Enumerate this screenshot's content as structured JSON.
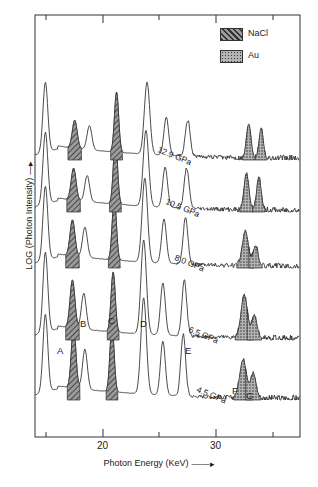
{
  "figure": {
    "kind": "energy-dispersive-x-ray-diffraction-spectra",
    "x_axis": {
      "label": "Photon Energy (KeV)",
      "ticks_major": [
        "20",
        "30"
      ]
    },
    "y_axis": {
      "label": "LOG (Photon Intensity)"
    }
  },
  "legend": {
    "items": [
      {
        "label": "NaCl",
        "pattern": "diagonal-hatch",
        "color": "#555555"
      },
      {
        "label": "Au",
        "pattern": "stipple-dots",
        "color": "#777777"
      }
    ]
  },
  "peak_labels": [
    {
      "id": "A",
      "x": 14.9,
      "trace": "4.5 GPa"
    },
    {
      "id": "B",
      "x": 17.4,
      "trace": "4.5 GPa"
    },
    {
      "id": "C",
      "x": 20.8,
      "trace": "4.5 GPa"
    },
    {
      "id": "D",
      "x": 23.6,
      "trace": "4.5 GPa"
    },
    {
      "id": "E",
      "x": 27.1,
      "trace": "4.5 GPa"
    },
    {
      "id": "F",
      "x": 32.4,
      "trace": "4.5 GPa"
    },
    {
      "id": "G",
      "x": 33.4,
      "trace": "4.5 GPa"
    }
  ],
  "chart_data": {
    "type": "line",
    "title": "",
    "xlabel": "Photon Energy (KeV)",
    "ylabel": "LOG (Photon Intensity)",
    "xlim": [
      13.6,
      37.4
    ],
    "ylim": [
      0,
      1
    ],
    "grid": false,
    "legend_position": "top-right",
    "stacked_offset": true,
    "tick_labels_x": [
      "20",
      "30"
    ],
    "minor_ticks_x": [
      15,
      25,
      35
    ],
    "series": [
      {
        "name": "4.5 GPa",
        "label": "4.5 GPa",
        "label_x": 28.3,
        "baseline_px": 400,
        "peaks": [
          {
            "id": "A",
            "x": 14.9,
            "h": 78,
            "w": 0.3,
            "fill": "none"
          },
          {
            "id": "B",
            "x": 17.4,
            "h": 62,
            "w": 0.28,
            "fill": "NaCl"
          },
          {
            "id": "B2",
            "x": 18.4,
            "h": 40,
            "w": 0.3,
            "fill": "none"
          },
          {
            "id": "C",
            "x": 20.8,
            "h": 66,
            "w": 0.26,
            "fill": "NaCl"
          },
          {
            "id": "D",
            "x": 23.6,
            "h": 96,
            "w": 0.34,
            "fill": "none"
          },
          {
            "id": "D2",
            "x": 25.3,
            "h": 54,
            "w": 0.3,
            "fill": "none"
          },
          {
            "id": "E",
            "x": 27.1,
            "h": 62,
            "w": 0.3,
            "fill": "none"
          },
          {
            "id": "F",
            "x": 32.4,
            "h": 38,
            "w": 0.42,
            "fill": "Au"
          },
          {
            "id": "G",
            "x": 33.3,
            "h": 24,
            "w": 0.34,
            "fill": "Au"
          }
        ]
      },
      {
        "name": "6.5 GPa",
        "label": "6.5 GPa",
        "label_x": 27.6,
        "baseline_px": 340,
        "peaks": [
          {
            "id": "A",
            "x": 14.9,
            "h": 80,
            "w": 0.3,
            "fill": "none"
          },
          {
            "id": "B",
            "x": 17.3,
            "h": 48,
            "w": 0.3,
            "fill": "NaCl"
          },
          {
            "id": "B2",
            "x": 18.3,
            "h": 36,
            "w": 0.3,
            "fill": "none"
          },
          {
            "id": "C",
            "x": 20.9,
            "h": 60,
            "w": 0.26,
            "fill": "NaCl"
          },
          {
            "id": "D",
            "x": 23.6,
            "h": 94,
            "w": 0.34,
            "fill": "none"
          },
          {
            "id": "D2",
            "x": 25.3,
            "h": 52,
            "w": 0.3,
            "fill": "none"
          },
          {
            "id": "E",
            "x": 27.2,
            "h": 56,
            "w": 0.3,
            "fill": "none"
          },
          {
            "id": "F",
            "x": 32.5,
            "h": 42,
            "w": 0.4,
            "fill": "Au"
          },
          {
            "id": "G",
            "x": 33.4,
            "h": 22,
            "w": 0.32,
            "fill": "Au"
          }
        ]
      },
      {
        "name": "8.0 GPa",
        "label": "8.0 GPa",
        "label_x": 26.4,
        "baseline_px": 268,
        "peaks": [
          {
            "id": "A",
            "x": 14.9,
            "h": 74,
            "w": 0.3,
            "fill": "none"
          },
          {
            "id": "B",
            "x": 17.3,
            "h": 36,
            "w": 0.3,
            "fill": "NaCl"
          },
          {
            "id": "B2",
            "x": 18.4,
            "h": 30,
            "w": 0.3,
            "fill": "none"
          },
          {
            "id": "C",
            "x": 21.0,
            "h": 62,
            "w": 0.26,
            "fill": "NaCl"
          },
          {
            "id": "D",
            "x": 23.7,
            "h": 84,
            "w": 0.34,
            "fill": "none"
          },
          {
            "id": "D2",
            "x": 25.4,
            "h": 44,
            "w": 0.3,
            "fill": "none"
          },
          {
            "id": "E",
            "x": 27.3,
            "h": 46,
            "w": 0.3,
            "fill": "none"
          },
          {
            "id": "F",
            "x": 32.6,
            "h": 34,
            "w": 0.38,
            "fill": "Au"
          },
          {
            "id": "G",
            "x": 33.5,
            "h": 20,
            "w": 0.3,
            "fill": "Au"
          }
        ]
      },
      {
        "name": "10.5 GPa",
        "label": "10.5 GPa",
        "label_x": 25.6,
        "baseline_px": 212,
        "peaks": [
          {
            "id": "A",
            "x": 14.9,
            "h": 72,
            "w": 0.3,
            "fill": "none"
          },
          {
            "id": "B",
            "x": 17.4,
            "h": 32,
            "w": 0.3,
            "fill": "NaCl"
          },
          {
            "id": "B2",
            "x": 18.6,
            "h": 26,
            "w": 0.3,
            "fill": "none"
          },
          {
            "id": "C",
            "x": 21.1,
            "h": 64,
            "w": 0.26,
            "fill": "NaCl"
          },
          {
            "id": "D",
            "x": 23.8,
            "h": 76,
            "w": 0.34,
            "fill": "none"
          },
          {
            "id": "D2",
            "x": 25.5,
            "h": 40,
            "w": 0.3,
            "fill": "none"
          },
          {
            "id": "E",
            "x": 27.4,
            "h": 40,
            "w": 0.3,
            "fill": "none"
          },
          {
            "id": "F",
            "x": 32.7,
            "h": 36,
            "w": 0.3,
            "fill": "Au"
          },
          {
            "id": "G",
            "x": 33.8,
            "h": 32,
            "w": 0.28,
            "fill": "Au"
          }
        ]
      },
      {
        "name": "12.9 GPa",
        "label": "12.9 GPa",
        "label_x": 24.9,
        "baseline_px": 160,
        "peaks": [
          {
            "id": "A",
            "x": 14.9,
            "h": 70,
            "w": 0.3,
            "fill": "none"
          },
          {
            "id": "B",
            "x": 17.5,
            "h": 28,
            "w": 0.3,
            "fill": "NaCl"
          },
          {
            "id": "B2",
            "x": 18.8,
            "h": 24,
            "w": 0.3,
            "fill": "none"
          },
          {
            "id": "C",
            "x": 21.2,
            "h": 60,
            "w": 0.26,
            "fill": "NaCl"
          },
          {
            "id": "D",
            "x": 23.9,
            "h": 72,
            "w": 0.34,
            "fill": "none"
          },
          {
            "id": "D2",
            "x": 25.6,
            "h": 38,
            "w": 0.3,
            "fill": "none"
          },
          {
            "id": "E",
            "x": 27.5,
            "h": 36,
            "w": 0.3,
            "fill": "none"
          },
          {
            "id": "F",
            "x": 32.9,
            "h": 34,
            "w": 0.28,
            "fill": "Au"
          },
          {
            "id": "G",
            "x": 34.0,
            "h": 30,
            "w": 0.26,
            "fill": "Au"
          }
        ]
      }
    ]
  }
}
